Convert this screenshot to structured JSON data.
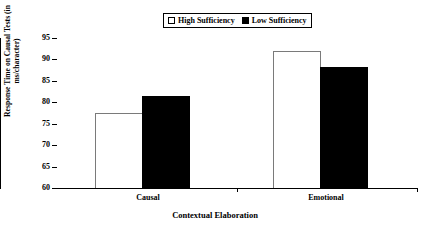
{
  "chart_data": {
    "type": "bar",
    "title": "",
    "xlabel": "Contextual Elaboration",
    "ylabel_line1": "Response Time on Causal Tests (in",
    "ylabel_line2": "ms/character)",
    "ylabel": "Response Time on Causal Tests (in ms/character)",
    "categories": [
      "Causal",
      "Emotional"
    ],
    "series": [
      {
        "name": "High Sufficiency",
        "values": [
          77.5,
          92.0
        ],
        "color": "#ffffff",
        "marker": "open-square"
      },
      {
        "name": "Low Sufficiency",
        "values": [
          81.5,
          88.2
        ],
        "color": "#000000",
        "marker": "filled-square"
      }
    ],
    "ylim": [
      60,
      95
    ],
    "yticks": [
      60,
      65,
      70,
      75,
      80,
      85,
      90,
      95
    ],
    "ytick_labels": [
      "60",
      "65",
      "70",
      "75",
      "80",
      "85",
      "90",
      "95"
    ],
    "grid": false,
    "legend_position": "top-center",
    "legend_entries": [
      "High Sufficiency",
      "Low Sufficiency"
    ]
  },
  "legend": {
    "entries": [
      {
        "label": "High Sufficiency",
        "swatch": "open-square-icon"
      },
      {
        "label": "Low Sufficiency",
        "swatch": "filled-square-icon"
      }
    ]
  },
  "axes": {
    "y_title_line1": "Response Time on Causal Tests (in",
    "y_title_line2": "ms/character)",
    "x_title": "Contextual Elaboration",
    "y_ticks": [
      "95",
      "90",
      "85",
      "80",
      "75",
      "70",
      "65",
      "60"
    ],
    "x_categories": [
      "Causal",
      "Emotional"
    ]
  }
}
